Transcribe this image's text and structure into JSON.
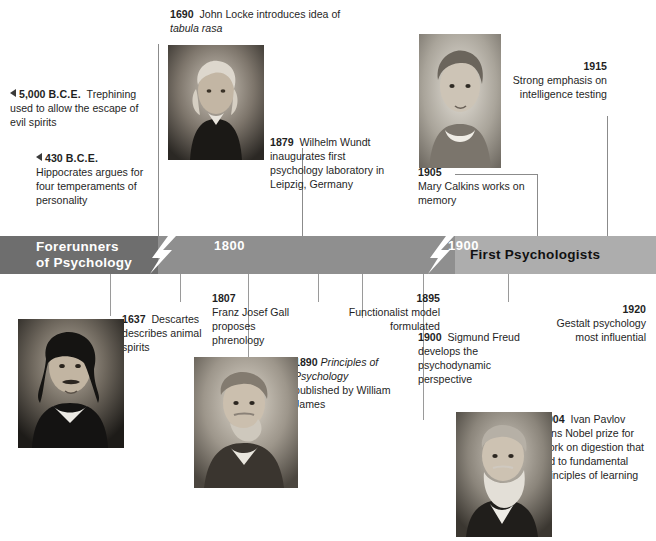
{
  "timeline": {
    "left_title": "Forerunners\nof Psychology",
    "left_title_line1": "Forerunners",
    "left_title_line2": "of Psychology",
    "right_title": "First Psychologists",
    "year_markers": [
      "1800",
      "1900"
    ],
    "marker_1800": "1800",
    "marker_1900": "1900",
    "colors": {
      "segment_dark": "#6e6e6e",
      "segment_mid": "#8f8f8f",
      "segment_light": "#adadad",
      "line": "#8b8b8b",
      "text": "#1f1f1f"
    }
  },
  "events": [
    {
      "id": "trephining",
      "year": "5,000 B.C.E.",
      "year_num": "5,000",
      "era": "B.C.E.",
      "text": "Trephining used to allow the escape of evil spirits",
      "marker": "left-triangle"
    },
    {
      "id": "hippocrates",
      "year": "430 B.C.E.",
      "year_num": "430",
      "era": "B.C.E.",
      "text": "Hippocrates argues for four temperaments of personality",
      "marker": "left-triangle"
    },
    {
      "id": "locke",
      "year": "1690",
      "text_part1": "John Locke introduces idea of ",
      "text_italic": "tabula rasa",
      "text": "John Locke introduces idea of tabula rasa"
    },
    {
      "id": "descartes",
      "year": "1637",
      "text": "Descartes describes animal spirits"
    },
    {
      "id": "gall",
      "year": "1807",
      "text": "Franz Josef Gall proposes phrenology"
    },
    {
      "id": "wundt",
      "year": "1879",
      "text": "Wilhelm Wundt inaugurates first psychology laboratory in Leipzig, Germany"
    },
    {
      "id": "james",
      "year": "1890",
      "text_italic": "Principles of Psychology",
      "text_after": " published by William James",
      "text": "Principles of Psychology published by William James"
    },
    {
      "id": "functionalist",
      "year": "1895",
      "text": "Functionalist model formulated"
    },
    {
      "id": "freud",
      "year": "1900",
      "text": "Sigmund Freud develops the psychodynamic perspective"
    },
    {
      "id": "pavlov",
      "year": "1904",
      "text": "Ivan Pavlov wins Nobel prize for work on digestion that led to fundamental principles of learning"
    },
    {
      "id": "calkins",
      "year": "1905",
      "text": "Mary Calkins works on memory"
    },
    {
      "id": "intelligence",
      "year": "1915",
      "text": "Strong emphasis on intelligence testing"
    },
    {
      "id": "gestalt",
      "year": "1920",
      "text": "Gestalt psychology most influential"
    }
  ],
  "portraits": [
    {
      "id": "locke-portrait",
      "caption": "John Locke"
    },
    {
      "id": "calkins-portrait",
      "caption": "Mary Calkins"
    },
    {
      "id": "descartes-portrait",
      "caption": "Rene Descartes"
    },
    {
      "id": "james-portrait",
      "caption": "William James"
    },
    {
      "id": "pavlov-portrait",
      "caption": "Ivan Pavlov"
    }
  ]
}
